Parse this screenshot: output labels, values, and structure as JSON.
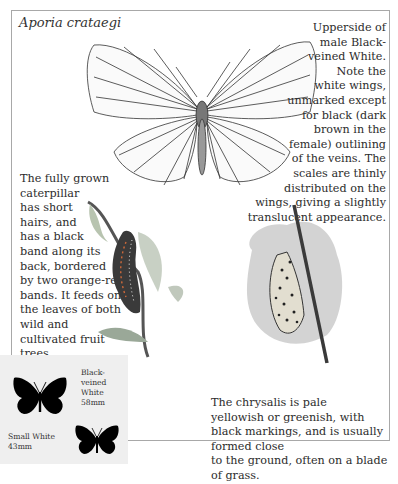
{
  "title": "Aporia crataegi",
  "captions": {
    "upperside": [
      "Upperside of",
      "male Black-",
      "veined White.",
      "Note the",
      "white wings,",
      "unmarked except",
      "for black (dark",
      "brown in the",
      "female) outlining",
      "of the veins. The",
      "scales are thinly",
      "distributed on the",
      "wings, giving a slightly",
      "translucent appearance."
    ],
    "caterpillar": [
      "The fully grown",
      "caterpillar",
      "has short",
      "hairs, and",
      "has a black",
      "band along its",
      "back, bordered",
      "by two orange-red",
      "bands. It feeds on",
      "the leaves of both",
      "wild and",
      "cultivated fruit",
      "trees."
    ],
    "chrysalis": [
      "The chrysalis is pale",
      "yellowish or greenish, with",
      "black markings, and is usually formed close",
      "to the ground, often on a blade of grass."
    ]
  },
  "size_comparison": {
    "black_veined": {
      "name_line1": "Black-veined",
      "name_line2": "White",
      "size": "58mm"
    },
    "small_white": {
      "name": "Small White",
      "size": "43mm"
    }
  },
  "colors": {
    "frame": "#a8a8a8",
    "inset_bg": "#efefef",
    "silhouette": "#000000"
  }
}
